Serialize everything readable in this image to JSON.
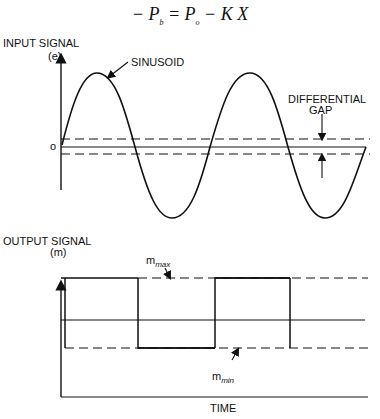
{
  "equation": {
    "minus": "− ",
    "Pb": "P",
    "Pb_sub": "b",
    "eq": " = ",
    "Po": "P",
    "Po_sub": "o",
    "rest": " − K X"
  },
  "input": {
    "title": "INPUT SIGNAL",
    "unit": "(e)",
    "zero_label": "o",
    "sinusoid_label": "SINUSOID",
    "gap_label_1": "DIFFERENTIAL",
    "gap_label_2": "GAP"
  },
  "output": {
    "title": "OUTPUT SIGNAL",
    "unit": "(m)",
    "max_label": "m",
    "max_sub": "max",
    "min_label": "m",
    "min_sub": "min",
    "x_label": "TIME"
  }
}
